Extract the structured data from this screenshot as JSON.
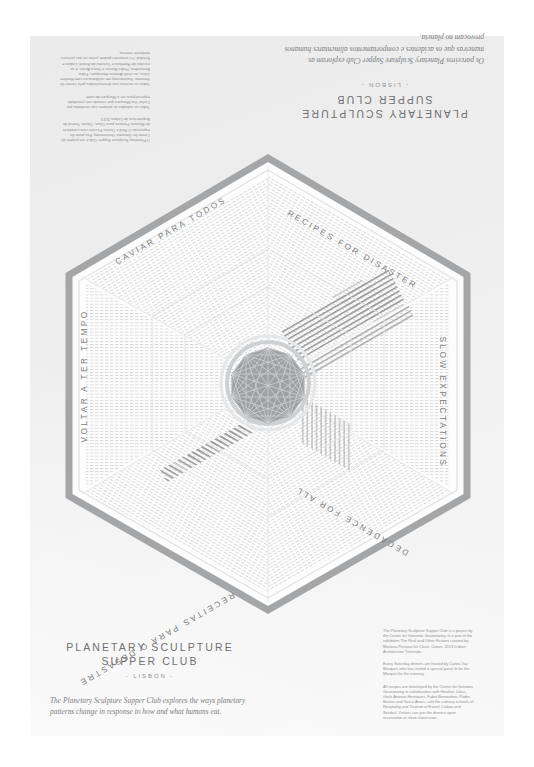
{
  "poster": {
    "background_color": "#ffffff",
    "sheet_color": "#eeeeee",
    "ink_color": "#7d7e80",
    "accent_gray": "#9b9c9e"
  },
  "masthead_en": {
    "title_line1": "PLANETARY SCULPTURE",
    "title_line2": "SUPPER CLUB",
    "city": "- LISBON -",
    "lede": "The Planetary Sculpture Supper Club explores the ways planetary patterns change in response to how and what humans eat."
  },
  "masthead_pt": {
    "title_line1": "PLANETARY SCULPTURE",
    "title_line2": "SUPPER CLUB",
    "city": "- LISBON -",
    "lede": "Os parceiros Planetary Sculpture Supper Club exploram as maneiras que os acidentes e comportamentos alimentares humanos provocam no planeta."
  },
  "credits_en": {
    "paragraphs": [
      "The Planetary Sculpture Supper Club is a project by the Center for Genomic Gastronomy. It is part of the exhibition The Real and Other Fictions curated by Mariana Pestana for Close, Closer, 2013 Lisbon Architecture Triennale.",
      "Every Saturday dinners are hosted by Carlos Vaz Marques who has invited a special guest to be the Marquis for the evening.",
      "All recipes are developed by the Center for Genomic Gastronomy in collaboration with Heather Julius, chefs Antonio Henriques, Fabio Bernardino, Pedro Bastos and Vasco Arrais, and the culinary schools of Hospitality and Tourism of Estoril, Lisboa and Setubal. Visitors can join the dinners upon reservation at close.closer.com."
    ]
  },
  "credits_pt": {
    "paragraphs": [
      "O Planetary Sculpture Supper Club e um projeto do Center for Genomic Gastronomy. Faz parte da exposicao O Real e Outras Ficcoes com curadoria de Mariana Pestana para Close, Closer, Trienal de Arquitectura de Lisboa 2013.",
      "Todos os sabados os jantares sao recebidos por Carlos Vaz Marques que convida um convidado especial para ser o Marques da noite.",
      "Todas as receitas sao desenvolvidas pelo Center for Genomic Gastronomy em colaboracao com Heather Julius, os chefs Antonio Henriques, Fabio Bernardino, Pedro Bastos e Vasco Arrais, e as escolas de Hotelaria e Turismo do Estoril, Lisboa e Setubal. Os visitantes podem juntar-se aos jantares mediante reserva."
    ]
  },
  "diagram": {
    "shape": "hexagon",
    "center_motif": "complete-graph-nonagon",
    "sectors": [
      {
        "id": "caviar",
        "label": "CAVIAR PARA TODOS",
        "position": "top-left",
        "language": "pt"
      },
      {
        "id": "recipes",
        "label": "RECIPES FOR DISASTER",
        "position": "top-right",
        "language": "en"
      },
      {
        "id": "slow",
        "label": "SLOW EXPECTATIONS",
        "position": "right",
        "language": "en"
      },
      {
        "id": "decadence",
        "label": "DECADENCE FOR ALL",
        "position": "bottom-right",
        "language": "en"
      },
      {
        "id": "receitas",
        "label": "RECEITAS PARA O DESASTRE",
        "position": "bottom-left",
        "language": "pt"
      },
      {
        "id": "voltar",
        "label": "VOLTAR A TER TEMPO",
        "position": "left",
        "language": "pt"
      }
    ]
  }
}
